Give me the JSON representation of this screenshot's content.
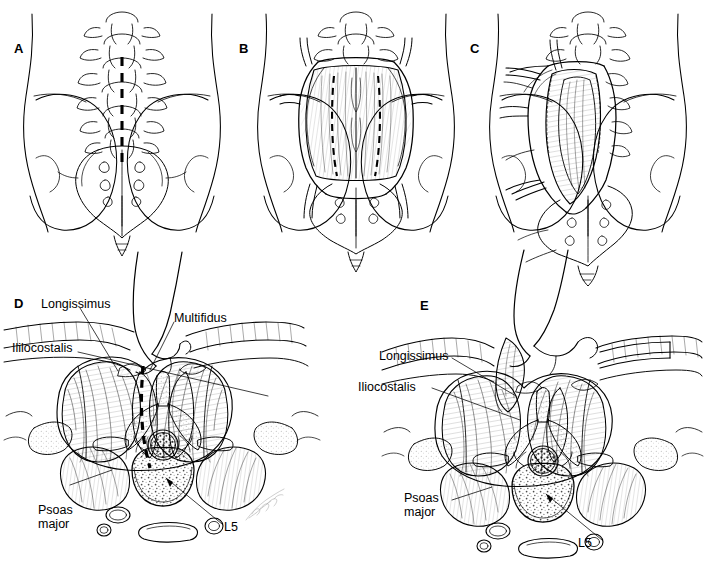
{
  "figure": {
    "background_color": "#ffffff",
    "ink_color": "#000000",
    "panels": [
      {
        "id": "A",
        "letter": "A",
        "caption_role": "posterior-view-midline-incision",
        "labels": []
      },
      {
        "id": "B",
        "letter": "B",
        "caption_role": "posterior-view-fascia-exposed-retracted",
        "labels": []
      },
      {
        "id": "C",
        "letter": "C",
        "caption_role": "posterior-view-deep-dissection-unilateral-retraction",
        "labels": []
      },
      {
        "id": "D",
        "letter": "D",
        "caption_role": "axial-cross-section-midline-approach",
        "labels": [
          {
            "name": "longissimus",
            "text": "Longissimus"
          },
          {
            "name": "iliocostalis",
            "text": "Ililocostalis"
          },
          {
            "name": "multifidus",
            "text": "Multifidus"
          },
          {
            "name": "psoas-major",
            "text": "Psoas\nmajor"
          },
          {
            "name": "l5",
            "text": "L5"
          }
        ]
      },
      {
        "id": "E",
        "letter": "E",
        "caption_role": "axial-cross-section-paramedian-approach",
        "labels": [
          {
            "name": "longissimus",
            "text": "Longissimus"
          },
          {
            "name": "iliocostalis",
            "text": "Iliocostalis"
          },
          {
            "name": "psoas-major",
            "text": "Psoas\nmajor"
          },
          {
            "name": "l5",
            "text": "L5"
          }
        ]
      }
    ]
  }
}
